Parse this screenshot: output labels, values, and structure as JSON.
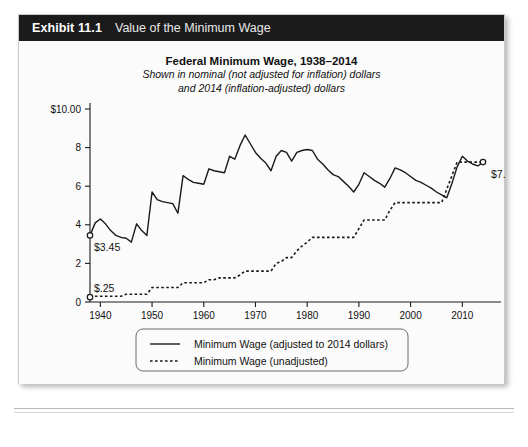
{
  "exhibit": {
    "number": "Exhibit 11.1",
    "caption": "Value of the Minimum Wage"
  },
  "chart_data": {
    "type": "line",
    "title": "Federal Minimum Wage, 1938–2014",
    "subtitle_line1": "Shown in nominal (not adjusted for inflation) dollars",
    "subtitle_line2": "and 2014 (inflation-adjusted) dollars",
    "xlabel": "",
    "ylabel": "",
    "xlim": [
      1938,
      2014
    ],
    "ylim": [
      0,
      10
    ],
    "grid": false,
    "legend_position": "bottom-center",
    "y_ticks": [
      0,
      2,
      4,
      6,
      8,
      10
    ],
    "y_tick_labels": [
      "0",
      "2",
      "4",
      "6",
      "8",
      "$10.00"
    ],
    "x_ticks": [
      1940,
      1950,
      1960,
      1970,
      1980,
      1990,
      2000,
      2010
    ],
    "x_tick_labels": [
      "1940",
      "1950",
      "1960",
      "1970",
      "1980",
      "1990",
      "2000",
      "2010"
    ],
    "annotations": [
      {
        "name": "start-adjusted",
        "text": "$3.45",
        "year": 1938,
        "value": 3.45
      },
      {
        "name": "start-unadjusted",
        "text": "$.25",
        "year": 1938,
        "value": 0.25
      },
      {
        "name": "end-unadjusted",
        "text": "$7.25",
        "year": 2014,
        "value": 7.25
      }
    ],
    "series": [
      {
        "name": "Minimum Wage (adjusted to 2014 dollars)",
        "style": "solid",
        "color": "#1a1a1a",
        "x": [
          1938,
          1939,
          1940,
          1941,
          1942,
          1943,
          1944,
          1945,
          1946,
          1947,
          1948,
          1949,
          1950,
          1951,
          1952,
          1953,
          1954,
          1955,
          1956,
          1957,
          1958,
          1959,
          1960,
          1961,
          1962,
          1963,
          1964,
          1965,
          1966,
          1967,
          1968,
          1969,
          1970,
          1971,
          1972,
          1973,
          1974,
          1975,
          1976,
          1977,
          1978,
          1979,
          1980,
          1981,
          1982,
          1983,
          1984,
          1985,
          1986,
          1987,
          1988,
          1989,
          1990,
          1991,
          1992,
          1993,
          1994,
          1995,
          1996,
          1997,
          1998,
          1999,
          2000,
          2001,
          2002,
          2003,
          2004,
          2005,
          2006,
          2007,
          2008,
          2009,
          2010,
          2011,
          2012,
          2013,
          2014
        ],
        "y": [
          3.45,
          4.1,
          4.3,
          4.05,
          3.7,
          3.45,
          3.35,
          3.3,
          3.1,
          4.05,
          3.7,
          3.45,
          5.7,
          5.3,
          5.2,
          5.15,
          5.1,
          4.6,
          6.55,
          6.35,
          6.2,
          6.15,
          6.1,
          6.9,
          6.8,
          6.75,
          6.7,
          7.55,
          7.4,
          8.1,
          8.65,
          8.2,
          7.75,
          7.45,
          7.2,
          6.8,
          7.55,
          7.85,
          7.75,
          7.3,
          7.75,
          7.85,
          7.9,
          7.85,
          7.4,
          7.15,
          6.85,
          6.6,
          6.5,
          6.25,
          6.0,
          5.7,
          6.1,
          6.7,
          6.5,
          6.3,
          6.15,
          5.95,
          6.4,
          6.95,
          6.85,
          6.7,
          6.5,
          6.3,
          6.2,
          6.05,
          5.9,
          5.7,
          5.55,
          5.4,
          6.15,
          7.0,
          7.55,
          7.3,
          7.15,
          7.05,
          7.25
        ]
      },
      {
        "name": "Minimum Wage (unadjusted)",
        "style": "dotted",
        "color": "#1a1a1a",
        "x": [
          1938,
          1939,
          1940,
          1941,
          1942,
          1943,
          1944,
          1945,
          1946,
          1947,
          1948,
          1949,
          1950,
          1951,
          1952,
          1953,
          1954,
          1955,
          1956,
          1957,
          1958,
          1959,
          1960,
          1961,
          1962,
          1963,
          1964,
          1965,
          1966,
          1967,
          1968,
          1969,
          1970,
          1971,
          1972,
          1973,
          1974,
          1975,
          1976,
          1977,
          1978,
          1979,
          1980,
          1981,
          1982,
          1983,
          1984,
          1985,
          1986,
          1987,
          1988,
          1989,
          1990,
          1991,
          1992,
          1993,
          1994,
          1995,
          1996,
          1997,
          1998,
          1999,
          2000,
          2001,
          2002,
          2003,
          2004,
          2005,
          2006,
          2007,
          2008,
          2009,
          2010,
          2011,
          2012,
          2013,
          2014
        ],
        "y": [
          0.25,
          0.3,
          0.3,
          0.3,
          0.3,
          0.3,
          0.3,
          0.4,
          0.4,
          0.4,
          0.4,
          0.4,
          0.75,
          0.75,
          0.75,
          0.75,
          0.75,
          0.75,
          1.0,
          1.0,
          1.0,
          1.0,
          1.0,
          1.15,
          1.15,
          1.25,
          1.25,
          1.25,
          1.25,
          1.4,
          1.6,
          1.6,
          1.6,
          1.6,
          1.6,
          1.6,
          2.0,
          2.1,
          2.3,
          2.3,
          2.65,
          2.9,
          3.1,
          3.35,
          3.35,
          3.35,
          3.35,
          3.35,
          3.35,
          3.35,
          3.35,
          3.35,
          3.8,
          4.25,
          4.25,
          4.25,
          4.25,
          4.25,
          4.75,
          5.15,
          5.15,
          5.15,
          5.15,
          5.15,
          5.15,
          5.15,
          5.15,
          5.15,
          5.15,
          5.85,
          6.55,
          7.25,
          7.25,
          7.25,
          7.25,
          7.25,
          7.25
        ]
      }
    ],
    "legend": [
      {
        "label": "Minimum Wage (adjusted to 2014 dollars)",
        "style": "solid"
      },
      {
        "label": "Minimum Wage (unadjusted)",
        "style": "dotted"
      }
    ]
  }
}
